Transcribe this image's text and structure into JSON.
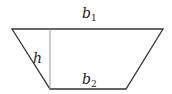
{
  "diagram": {
    "labels": {
      "top_base": {
        "var": "b",
        "sub": "1"
      },
      "bottom_base": {
        "var": "b",
        "sub": "2"
      },
      "height": {
        "var": "h"
      }
    },
    "colors": {
      "edge": "#333333",
      "height_line": "#999999",
      "text": "#222222"
    }
  }
}
